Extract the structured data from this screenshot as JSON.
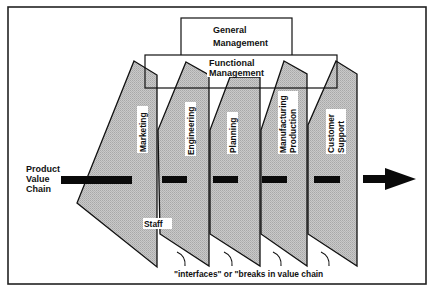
{
  "diagram": {
    "general_management": {
      "line1": "General",
      "line2": "Management"
    },
    "functional_management": {
      "line1": "Functional",
      "line2": "Management"
    },
    "functions": [
      {
        "id": "marketing",
        "lines": [
          "Marketing"
        ]
      },
      {
        "id": "engineering",
        "lines": [
          "Engineering"
        ]
      },
      {
        "id": "planning",
        "lines": [
          "Planning"
        ]
      },
      {
        "id": "manufacturing-production",
        "lines": [
          "Manufacturing",
          "Production"
        ]
      },
      {
        "id": "customer-support",
        "lines": [
          "Customer",
          "Support"
        ]
      }
    ],
    "value_chain_label": {
      "line1": "Product",
      "line2": "Value",
      "line3": "Chain"
    },
    "staff_label": "Staff",
    "interfaces_caption": "\"interfaces\" or \"breaks in value chain",
    "colors": {
      "panel_fill": "#c4c4c4",
      "stroke": "#111111",
      "bar": "#0a0a0a",
      "background": "#ffffff"
    }
  }
}
